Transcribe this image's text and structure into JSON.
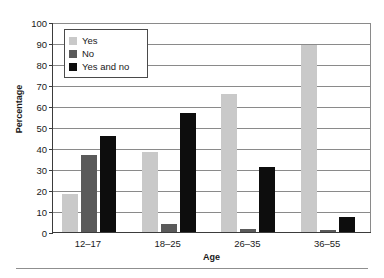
{
  "chart_data": {
    "type": "bar",
    "title": "",
    "xlabel": "Age",
    "ylabel": "Percentage",
    "categories": [
      "12–17",
      "18–25",
      "26–35",
      "36–55"
    ],
    "series": [
      {
        "name": "Yes",
        "color": "#c9c9c9",
        "values": [
          18,
          38,
          65.5,
          89
        ]
      },
      {
        "name": "No",
        "color": "#5a5a5a",
        "values": [
          36.5,
          4,
          1.5,
          1
        ]
      },
      {
        "name": "Yes and no",
        "color": "#0d0d0d",
        "values": [
          45.5,
          56.5,
          31,
          7
        ]
      }
    ],
    "ylim": [
      0,
      100
    ],
    "ytick_values": [
      0,
      10,
      20,
      30,
      40,
      50,
      60,
      70,
      80,
      90,
      100
    ],
    "ytick_labels": [
      "0",
      "10",
      "20",
      "30",
      "40",
      "50",
      "60",
      "70",
      "80",
      "90",
      "100"
    ],
    "grid": true,
    "legend_position": "upper-left-inside"
  },
  "legend": {
    "items": [
      {
        "label": "Yes",
        "color": "#c9c9c9"
      },
      {
        "label": "No",
        "color": "#5a5a5a"
      },
      {
        "label": "Yes and no",
        "color": "#0d0d0d"
      }
    ]
  }
}
